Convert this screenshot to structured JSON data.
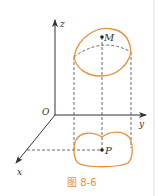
{
  "figure": {
    "caption": "图 8-6",
    "axes": {
      "x_label": "x",
      "y_label": "y",
      "z_label": "z",
      "origin_label": "O"
    },
    "points": {
      "upper": "M",
      "lower": "P"
    },
    "colors": {
      "curve": "#e8913a",
      "axis": "#333333",
      "dashed": "#444444",
      "caption": "#e8913a",
      "border": "#f0ece6"
    }
  }
}
